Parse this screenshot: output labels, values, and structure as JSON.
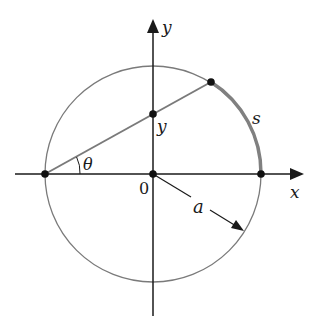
{
  "diagram": {
    "colors": {
      "axis": "#1a1a1a",
      "circle": "#7a7a7a",
      "secant": "#7a7a7a",
      "arc": "#808080",
      "point": "#111111",
      "background": "#ffffff"
    },
    "labels": {
      "y_axis": "y",
      "x_axis": "x",
      "y_intercept": "y",
      "arc_length": "s",
      "angle": "θ",
      "origin": "0",
      "radius": "a"
    },
    "geometry": {
      "center": [
        153,
        174
      ],
      "radius": 108,
      "points": [
        {
          "name": "left-point",
          "xy": [
            45,
            174
          ]
        },
        {
          "name": "origin-point",
          "xy": [
            153,
            174
          ]
        },
        {
          "name": "right-point",
          "xy": [
            261,
            174
          ]
        },
        {
          "name": "y-intercept-point",
          "xy": [
            153,
            114
          ]
        },
        {
          "name": "circle-point",
          "xy": [
            211,
            82
          ]
        }
      ]
    }
  }
}
